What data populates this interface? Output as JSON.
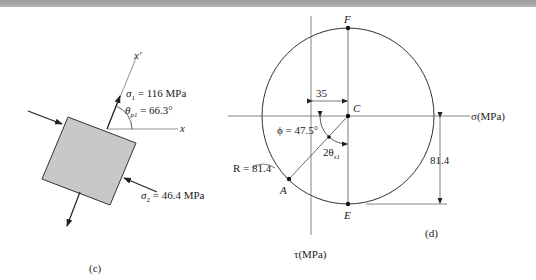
{
  "figure_c": {
    "caption": "(c)",
    "axis_x": "x",
    "axis_x_prime": "x'",
    "sigma1_label": "σ",
    "sigma1_sub": "1",
    "sigma1_value": " = 116 MPa",
    "theta_label": "θ",
    "theta_sub": "p1",
    "theta_value": " = 66.3°",
    "sigma2_label": "σ",
    "sigma2_sub": "2",
    "sigma2_value": " = 46.4 MPa"
  },
  "figure_d": {
    "caption": "(d)",
    "point_F": "F",
    "point_C": "C",
    "point_A": "A",
    "point_E": "E",
    "sigma_axis": "σ(MPa)",
    "tau_axis": "τ(MPa)",
    "dim_35": "35",
    "dim_81_4": "81.4",
    "radius_label": "R = 81.4",
    "phi_label": "ϕ = 47.5°",
    "two_theta": "2θ",
    "two_theta_sub": "s1"
  },
  "colors": {
    "element_fill": "#c8c8c8",
    "line": "#333333",
    "topbar": "#a8a8a8"
  }
}
